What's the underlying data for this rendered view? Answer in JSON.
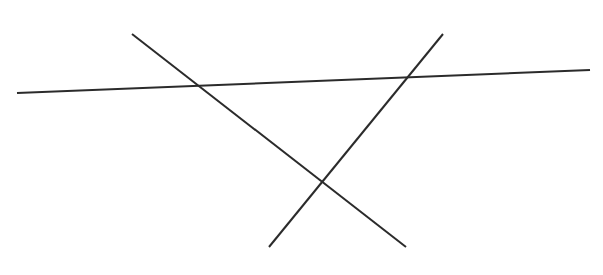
{
  "diagram": {
    "width": 603,
    "height": 275,
    "background": "#ffffff",
    "stroke_color": "#2b2b2b",
    "stroke_width": 2,
    "lines": [
      {
        "name": "transversal-line",
        "x1": 17,
        "y1": 93,
        "x2": 590,
        "y2": 70
      },
      {
        "name": "descending-line",
        "x1": 132,
        "y1": 34,
        "x2": 406,
        "y2": 247
      },
      {
        "name": "ascending-line",
        "x1": 443,
        "y1": 34,
        "x2": 269,
        "y2": 247
      }
    ],
    "intersections": [
      {
        "between": [
          "transversal-line",
          "descending-line"
        ],
        "x": 199,
        "y": 86
      },
      {
        "between": [
          "transversal-line",
          "ascending-line"
        ],
        "x": 408,
        "y": 77
      },
      {
        "between": [
          "descending-line",
          "ascending-line"
        ],
        "x": 322,
        "y": 181
      }
    ]
  }
}
